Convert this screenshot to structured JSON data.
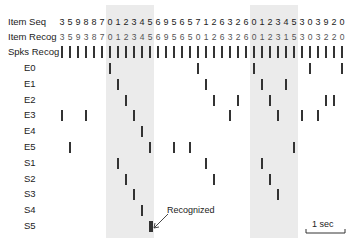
{
  "figure": {
    "start_x": 62,
    "spacing": 8,
    "shaded_bands": [
      {
        "start_index": 6,
        "end_index": 11
      },
      {
        "start_index": 24,
        "end_index": 29
      }
    ],
    "band_color": "#ebebeb"
  },
  "rows": {
    "item_seq": {
      "label": "Item Seq",
      "values": [
        "3",
        "5",
        "9",
        "8",
        "8",
        "7",
        "0",
        "1",
        "2",
        "3",
        "4",
        "5",
        "6",
        "9",
        "5",
        "6",
        "5",
        "7",
        "1",
        "2",
        "6",
        "3",
        "2",
        "6",
        "0",
        "1",
        "2",
        "3",
        "4",
        "5",
        "3",
        "0",
        "3",
        "9",
        "2",
        "0"
      ]
    },
    "item_recog": {
      "label": "Item Recog",
      "values": [
        "3",
        "5",
        "9",
        "3",
        "8",
        "7",
        "0",
        "1",
        "2",
        "3",
        "4",
        "5",
        "6",
        "9",
        "5",
        "6",
        "5",
        "0",
        "1",
        "2",
        "6",
        "3",
        "2",
        "6",
        "0",
        "1",
        "2",
        "3",
        "1",
        "5",
        "3",
        "0",
        "3",
        "2",
        "2",
        "0"
      ]
    },
    "spks_recog": {
      "label": "Spks Recog",
      "count": 36
    }
  },
  "neurons": [
    {
      "label": "E0",
      "spikes": [
        6,
        17,
        24,
        31,
        35
      ]
    },
    {
      "label": "E1",
      "spikes": [
        7,
        18,
        25,
        28
      ]
    },
    {
      "label": "E2",
      "spikes": [
        8,
        19,
        22,
        26,
        33,
        34
      ]
    },
    {
      "label": "E3",
      "spikes": [
        0,
        3,
        9,
        21,
        27,
        30,
        32
      ]
    },
    {
      "label": "E4",
      "spikes": [
        10
      ]
    },
    {
      "label": "E5",
      "spikes": [
        1,
        11,
        14,
        16,
        29
      ]
    },
    {
      "label": "S1",
      "spikes": [
        7,
        18,
        25
      ]
    },
    {
      "label": "S2",
      "spikes": [
        8,
        19,
        26
      ]
    },
    {
      "label": "S3",
      "spikes": [
        9,
        27
      ]
    },
    {
      "label": "S4",
      "spikes": [
        10
      ]
    },
    {
      "label": "S5",
      "spikes": [
        11
      ]
    }
  ],
  "annotation": {
    "text": "Recognized",
    "target_row": "S5",
    "target_index": 11
  },
  "scale_bar": {
    "label": "1 sec"
  }
}
